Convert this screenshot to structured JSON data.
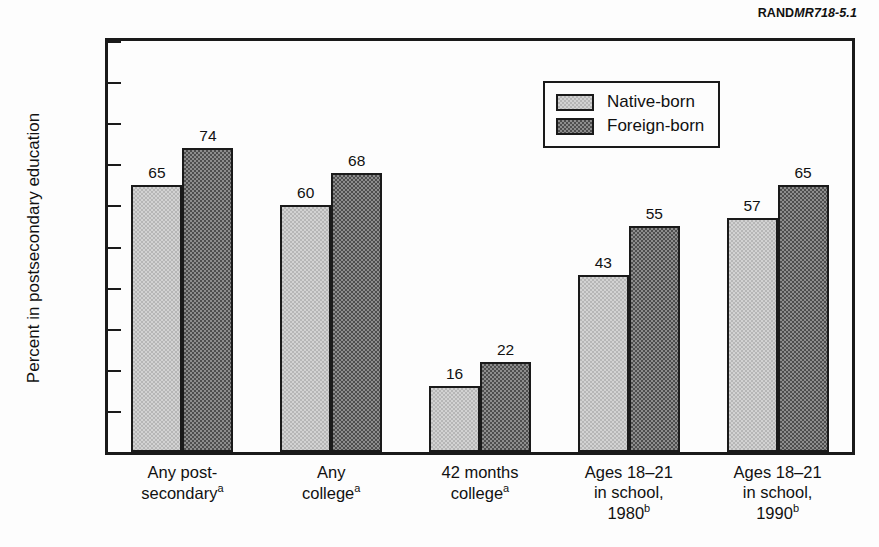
{
  "figure": {
    "id_prefix": "RAND",
    "id_suffix": "MR718-5.1"
  },
  "chart_data": {
    "type": "bar",
    "title": "",
    "xlabel": "",
    "ylabel": "Percent in postsecondary education",
    "ylim": [
      0,
      100
    ],
    "ytick_values": [
      100,
      90,
      80,
      70,
      60,
      50,
      40,
      30,
      20,
      10,
      0
    ],
    "ytick_labels": [
      "100",
      "90",
      "80",
      "70",
      "60",
      "50",
      "40",
      "30",
      "20",
      "10",
      "0"
    ],
    "grid": false,
    "legend_position": "upper-center-right",
    "categories": [
      "Any post-secondaryᵃ",
      "Any collegeᵃ",
      "42 months collegeᵃ",
      "Ages 18–21 in school, 1980ᵇ",
      "Ages 18–21 in school, 1990ᵇ"
    ],
    "category_lines": [
      [
        "Any post-",
        "secondary",
        "a"
      ],
      [
        "Any",
        "college",
        "a"
      ],
      [
        "42 months",
        "college",
        "a"
      ],
      [
        "Ages 18–21",
        "in school,",
        "1980",
        "b"
      ],
      [
        "Ages 18–21",
        "in school,",
        "1990",
        "b"
      ]
    ],
    "series": [
      {
        "name": "Native-born",
        "color": "#d2d2d2",
        "values": [
          65,
          60,
          16,
          43,
          57
        ]
      },
      {
        "name": "Foreign-born",
        "color": "#8d8d8d",
        "values": [
          74,
          68,
          22,
          55,
          65
        ]
      }
    ]
  },
  "legend": {
    "items": [
      {
        "label": "Native-born",
        "style": "light"
      },
      {
        "label": "Foreign-born",
        "style": "dark"
      }
    ]
  },
  "colors": {
    "axis": "#1a1a1a",
    "background": "#fdfdfd",
    "native_fill": "#d2d2d2",
    "foreign_fill": "#8d8d8d"
  }
}
